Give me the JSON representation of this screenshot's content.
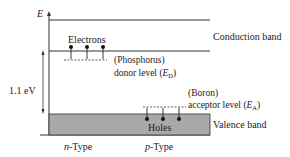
{
  "diagram": {
    "axis_label": "E",
    "energy_gap_label": "1.1 eV",
    "conduction_band_label": "Conduction band",
    "valence_band_label": "Valence band",
    "electrons_label": "Electrons",
    "holes_label": "Holes",
    "donor": {
      "line1": "(Phosphorus)",
      "line2_prefix": "donor level (",
      "symbol": "E",
      "subscript": "D",
      "suffix": ")"
    },
    "acceptor": {
      "line1": "(Boron)",
      "line2_prefix": "acceptor level (",
      "symbol": "E",
      "subscript": "A",
      "suffix": ")"
    },
    "n_type": {
      "italic": "n",
      "rest": "-Type"
    },
    "p_type": {
      "italic": "p",
      "rest": "-Type"
    },
    "electron_count": 3,
    "hole_count": 3,
    "colors": {
      "line": "#333333",
      "valence_fill": "#a9a9a9"
    }
  }
}
